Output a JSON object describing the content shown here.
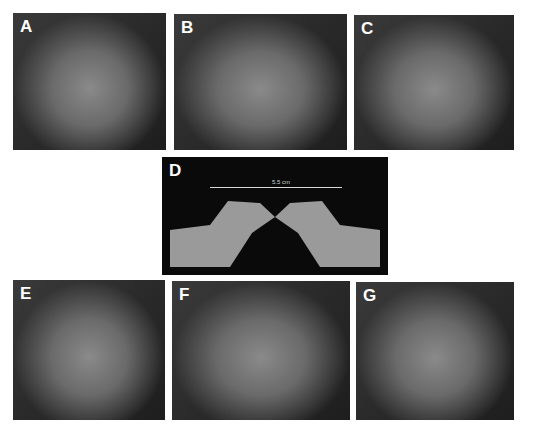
{
  "figure": {
    "panels": [
      {
        "id": "A",
        "label": "A",
        "kind": "photo",
        "view": "frontal-preop"
      },
      {
        "id": "B",
        "label": "B",
        "kind": "photo",
        "view": "oblique-preop"
      },
      {
        "id": "C",
        "label": "C",
        "kind": "photo",
        "view": "lateral-preop"
      },
      {
        "id": "D",
        "label": "D",
        "kind": "3d-scan",
        "measurement": "5.5 cm"
      },
      {
        "id": "E",
        "label": "E",
        "kind": "photo",
        "view": "frontal-postop"
      },
      {
        "id": "F",
        "label": "F",
        "kind": "photo",
        "view": "oblique-postop"
      },
      {
        "id": "G",
        "label": "G",
        "kind": "photo",
        "view": "lateral-postop"
      }
    ]
  },
  "colors": {
    "background": "#ffffff",
    "panel_bg": "#2a2a2a",
    "label": "#ffffff"
  }
}
